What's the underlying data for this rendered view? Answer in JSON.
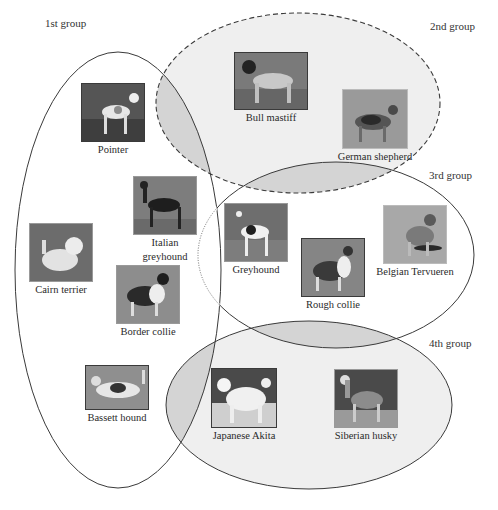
{
  "colors": {
    "background": "#ffffff",
    "outline": "#3a3a3a",
    "region_fill": "#efefef",
    "overlap_fill": "#d4d4d4"
  },
  "groups": [
    {
      "id": "group-1",
      "label": "1st group",
      "border": "solid"
    },
    {
      "id": "group-2",
      "label": "2nd group",
      "border": "dashed"
    },
    {
      "id": "group-3",
      "label": "3rd group",
      "border": "solid"
    },
    {
      "id": "group-4",
      "label": "4th group",
      "border": "solid"
    }
  ],
  "dogs": [
    {
      "name": "Pointer",
      "group": "1st group"
    },
    {
      "name": "Italian greyhound",
      "line1": "Italian",
      "line2": "greyhound",
      "group": "1st group"
    },
    {
      "name": "Cairn terrier",
      "group": "1st group"
    },
    {
      "name": "Border collie",
      "group": "1st group"
    },
    {
      "name": "Bassett hound",
      "group": "1st group"
    },
    {
      "name": "Bull mastiff",
      "group": "2nd group"
    },
    {
      "name": "German shepherd",
      "group": "2nd group"
    },
    {
      "name": "Greyhound",
      "group": "3rd group"
    },
    {
      "name": "Rough collie",
      "group": "3rd group"
    },
    {
      "name": "Belgian Tervueren",
      "group": "3rd group"
    },
    {
      "name": "Japanese Akita",
      "group": "4th group"
    },
    {
      "name": "Siberian husky",
      "group": "4th group"
    }
  ]
}
